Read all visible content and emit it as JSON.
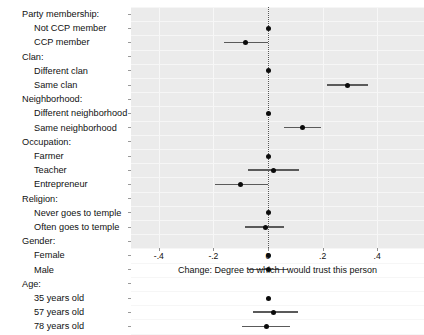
{
  "chart_data": {
    "type": "scatter",
    "title": "",
    "subtitle": "",
    "xlabel": "Change: Degree to which I would trust this person",
    "ylabel": "",
    "xlim": [
      -0.5,
      0.57
    ],
    "xticks": [
      -0.4,
      -0.2,
      0,
      0.2,
      0.4
    ],
    "xticklabels": [
      "-.4",
      "-.2",
      "0",
      ".2",
      ".4"
    ],
    "grid": true,
    "legend": null,
    "zero_reference_line": 0,
    "plot_style": "coefficient / forest plot with 95% confidence intervals",
    "groups": [
      {
        "name": "Party membership:",
        "rows": [
          {
            "label": "Not CCP member",
            "estimate": 0.0,
            "ci_low": null,
            "ci_high": null,
            "reference": true
          },
          {
            "label": "CCP member",
            "estimate": -0.082,
            "ci_low": -0.163,
            "ci_high": 0.0,
            "reference": false
          }
        ]
      },
      {
        "name": "Clan:",
        "rows": [
          {
            "label": "Different clan",
            "estimate": 0.0,
            "ci_low": null,
            "ci_high": null,
            "reference": true
          },
          {
            "label": "Same clan",
            "estimate": 0.292,
            "ci_low": 0.215,
            "ci_high": 0.368,
            "reference": false
          }
        ]
      },
      {
        "name": "Neighborhood:",
        "rows": [
          {
            "label": "Different neighborhood",
            "estimate": 0.0,
            "ci_low": null,
            "ci_high": null,
            "reference": true
          },
          {
            "label": "Same neighborhood",
            "estimate": 0.126,
            "ci_low": 0.057,
            "ci_high": 0.196,
            "reference": false
          }
        ]
      },
      {
        "name": "Occupation:",
        "rows": [
          {
            "label": "Farmer",
            "estimate": 0.0,
            "ci_low": null,
            "ci_high": null,
            "reference": true
          },
          {
            "label": "Teacher",
            "estimate": 0.02,
            "ci_low": -0.072,
            "ci_high": 0.115,
            "reference": false
          },
          {
            "label": "Entrepreneur",
            "estimate": -0.099,
            "ci_low": -0.193,
            "ci_high": 0.0,
            "reference": false
          }
        ]
      },
      {
        "name": "Religion:",
        "rows": [
          {
            "label": "Never goes to temple",
            "estimate": 0.0,
            "ci_low": null,
            "ci_high": null,
            "reference": true
          },
          {
            "label": "Often goes to temple",
            "estimate": -0.01,
            "ci_low": -0.083,
            "ci_high": 0.06,
            "reference": false
          }
        ]
      },
      {
        "name": "Gender:",
        "rows": [
          {
            "label": "Female",
            "estimate": 0.0,
            "ci_low": null,
            "ci_high": null,
            "reference": true
          },
          {
            "label": "Male",
            "estimate": 0.0,
            "ci_low": -0.072,
            "ci_high": 0.072,
            "reference": false
          }
        ]
      },
      {
        "name": "Age:",
        "rows": [
          {
            "label": "35 years old",
            "estimate": 0.0,
            "ci_low": null,
            "ci_high": null,
            "reference": true
          },
          {
            "label": "57 years old",
            "estimate": 0.021,
            "ci_low": -0.055,
            "ci_high": 0.111,
            "reference": false
          },
          {
            "label": "78 years old",
            "estimate": -0.005,
            "ci_low": -0.095,
            "ci_high": 0.08,
            "reference": false
          }
        ]
      }
    ]
  },
  "colors": {
    "panel_background": "#ebebeb",
    "gridline": "#f7f7f7",
    "point": "#0b0b0b",
    "interval": "#5a5a5a",
    "zero_line": "#555555",
    "text": "#111111",
    "page_background": "#ffffff"
  }
}
